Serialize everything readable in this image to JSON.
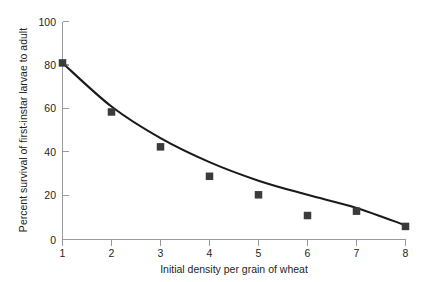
{
  "chart_data": {
    "type": "scatter",
    "title": "",
    "subtitle": "",
    "xlabel": "Initial density per grain of wheat",
    "ylabel": "Percent survival of first-instar larvae to adult",
    "xlim": [
      1,
      8
    ],
    "ylim": [
      0,
      100
    ],
    "xticks": [
      1,
      2,
      3,
      4,
      5,
      6,
      7,
      8
    ],
    "xtick_labels": [
      "1",
      "2",
      "3",
      "4",
      "5",
      "6",
      "7",
      "8"
    ],
    "yticks": [
      0,
      20,
      40,
      60,
      80,
      100
    ],
    "ytick_labels": [
      "0",
      "20",
      "40",
      "60",
      "80",
      "100"
    ],
    "grid": false,
    "legend": false,
    "legend_position": "none",
    "x": [
      1,
      2,
      3,
      4,
      5,
      6,
      7,
      8
    ],
    "values": [
      81,
      58.5,
      42.5,
      29,
      20.5,
      11,
      13,
      6
    ],
    "series": [
      {
        "name": "Observed percent survival",
        "marker": "square",
        "marker_color": "#3b3b3b",
        "values": [
          81,
          58.5,
          42.5,
          29,
          20.5,
          11,
          13,
          6
        ]
      },
      {
        "name": "Fitted decline curve",
        "type": "line",
        "line_color": "#1a1a1a",
        "x": [
          1,
          2,
          3,
          4,
          5,
          6,
          7,
          8
        ],
        "values": [
          81,
          61,
          46.5,
          35.5,
          27,
          20.5,
          14.5,
          6.5
        ]
      }
    ],
    "annotations": []
  },
  "axes": {
    "x_axis_label": "Initial density per grain of wheat",
    "y_axis_label": "Percent survival of first-instar larvae to adult",
    "x_tick_labels": [
      "1",
      "2",
      "3",
      "4",
      "5",
      "6",
      "7",
      "8"
    ],
    "y_tick_labels": [
      "0",
      "20",
      "40",
      "60",
      "80",
      "100"
    ]
  },
  "colors": {
    "marker": "#3b3b3b",
    "curve": "#1a1a1a",
    "axis": "#9a9a9a",
    "text": "#231f20",
    "background": "#ffffff"
  }
}
